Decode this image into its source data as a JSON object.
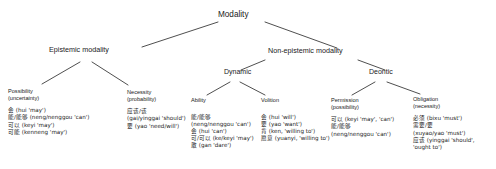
{
  "diagram": {
    "title_node": "Modality",
    "style": {
      "line_color": "#3b3b3b",
      "text_color": "#1a1a1a",
      "background": "#ffffff"
    },
    "level2": [
      {
        "label": "Epistemic modality"
      },
      {
        "label": "Non-epistemic modality"
      }
    ],
    "level3": [
      {
        "label": "Dynamic"
      },
      {
        "label": "Deontic"
      }
    ],
    "leaves": [
      {
        "head": "Possibility",
        "sub": "(uncertainty)",
        "items": [
          "会 (hui 'may')",
          "能/能够 (neng/nenggou 'can')",
          "可以 (keyi 'may')",
          "可能 (kenneng 'may')"
        ]
      },
      {
        "head": "Necessity",
        "sub": "(probability)",
        "items": [
          "应该/该",
          "(gai/yinggai 'should')",
          "要 (yao 'need/will')"
        ]
      },
      {
        "head": "Ability",
        "sub": "",
        "items": [
          "能/能够",
          "(neng/nenggou 'can')",
          "会 (hui 'can')",
          "可/可以 (ke/keyi 'may')",
          "敢 (gan 'dare')"
        ]
      },
      {
        "head": "Volition",
        "sub": "",
        "items": [
          "会 (hui 'will')",
          "要 (yao 'want')",
          "肯 (ken, 'willing to')",
          "愿意 (yuanyi, 'willing to')"
        ]
      },
      {
        "head": "Permission",
        "sub": "(possibility)",
        "items": [
          "可以 (keyi 'may', 'can')",
          "能/能够",
          "(neng/nenggou 'can')"
        ]
      },
      {
        "head": "Obligation",
        "sub": "(necessity)",
        "items": [
          "必须 (bixu 'must')",
          "需要/要",
          "(xuyao/yao 'must')",
          "应该 (yinggai 'should',",
          "'ought to')"
        ]
      }
    ]
  }
}
